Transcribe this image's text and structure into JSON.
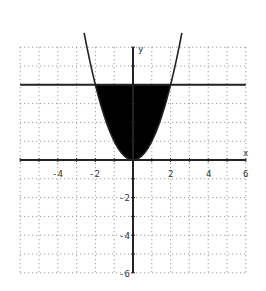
{
  "chart_data": {
    "type": "area",
    "title": "",
    "xlabel": "x",
    "ylabel": "y",
    "xlim": [
      -6,
      6
    ],
    "ylim": [
      -6,
      6
    ],
    "grid": true,
    "grid_style": "dotted",
    "x_ticks": [
      -4,
      -2,
      2,
      4,
      6
    ],
    "y_ticks": [
      -2,
      -4,
      -6
    ],
    "x_tick_labels": [
      "-4",
      "-2",
      "2",
      "4",
      "6"
    ],
    "y_tick_labels": [
      "-2",
      "-4",
      "-6"
    ],
    "series": [
      {
        "name": "y = x^2",
        "kind": "curve",
        "x": [
          -2.5,
          -2,
          -1,
          0,
          1,
          2,
          2.5
        ],
        "y": [
          6.25,
          4,
          1,
          0,
          1,
          4,
          6.25
        ]
      },
      {
        "name": "y = 4",
        "kind": "line",
        "x": [
          -6,
          6
        ],
        "y": [
          4,
          4
        ]
      }
    ],
    "shaded_region": {
      "lower": "y = x^2",
      "upper": "y = 4",
      "x_range": [
        -2,
        2
      ],
      "color": "#000000"
    },
    "legend": null
  },
  "colors": {
    "fill": "#000000",
    "curve": "#222222",
    "axis": "#222222",
    "grid": "#888888"
  },
  "labels": {
    "x_axis": "x",
    "y_axis": "y",
    "tick_x_m4": "-4",
    "tick_x_m2": "-2",
    "tick_x_2": "2",
    "tick_x_4": "4",
    "tick_x_6": "6",
    "tick_y_m2": "-2",
    "tick_y_m4": "-4",
    "tick_y_m6": "-6"
  }
}
